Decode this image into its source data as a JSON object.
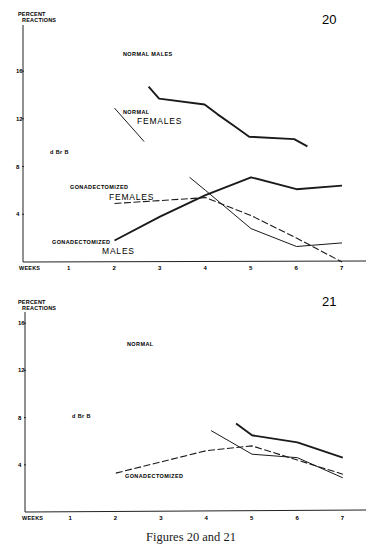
{
  "caption": "Figures 20 and 21",
  "chart_data": [
    {
      "type": "line",
      "figure_number": "20",
      "ylabel": "PERCENT REACTIONS",
      "xlabel": "WEEKS",
      "xticks": [
        1,
        2,
        3,
        4,
        5,
        6,
        7
      ],
      "yticks": [
        4,
        8,
        12,
        16
      ],
      "xlim": [
        0,
        7.6
      ],
      "ylim": [
        0,
        18
      ],
      "grid": false,
      "annotations": [
        "d Br B"
      ],
      "series": [
        {
          "name": "Normal males",
          "label_lines": [
            "NORMAL MALES"
          ],
          "style": "thick-solid",
          "points": [
            [
              2.75,
              14.7
            ],
            [
              2.98,
              13.7
            ],
            [
              3.98,
              13.2
            ],
            [
              4.26,
              12.4
            ],
            [
              4.67,
              11.3
            ],
            [
              4.96,
              10.5
            ],
            [
              5.95,
              10.3
            ],
            [
              6.24,
              9.7
            ]
          ]
        },
        {
          "name": "Normal females",
          "label_lines": [
            "NORMAL",
            "FEMALES"
          ],
          "style": "thin-solid",
          "points": [
            [
              2.0,
              12.9
            ],
            [
              2.65,
              10.1
            ]
          ]
        },
        {
          "name": "Gonadectomized males",
          "label_lines": [
            "GONADECTOMIZED",
            "MALES"
          ],
          "style": "thick-solid",
          "points": [
            [
              2,
              1.8
            ],
            [
              3,
              3.8
            ],
            [
              4,
              5.6
            ],
            [
              5,
              7.1
            ],
            [
              6,
              6.1
            ],
            [
              7,
              6.4
            ]
          ]
        },
        {
          "name": "Gonadectomized (thin)",
          "style": "thin-solid",
          "points": [
            [
              3.65,
              7.1
            ],
            [
              4,
              6.0
            ],
            [
              5,
              2.8
            ],
            [
              6,
              1.3
            ],
            [
              7,
              1.6
            ]
          ]
        },
        {
          "name": "Gonadectomized females",
          "label_lines": [
            "GONADECTOMIZED",
            "FEMALES"
          ],
          "style": "dashed",
          "points": [
            [
              2,
              4.9
            ],
            [
              4,
              5.4
            ],
            [
              5,
              3.9
            ],
            [
              6,
              2.0
            ],
            [
              7,
              0
            ]
          ]
        }
      ]
    },
    {
      "type": "line",
      "figure_number": "21",
      "ylabel": "PERCENT REACTIONS",
      "xlabel": "WEEKS",
      "xticks": [
        1,
        2,
        3,
        4,
        5,
        6,
        7
      ],
      "yticks": [
        4,
        8,
        12,
        16
      ],
      "xlim": [
        0,
        7.6
      ],
      "ylim": [
        0,
        17
      ],
      "grid": false,
      "annotations": [
        "d Br B",
        "NORMAL",
        "GONADECTOMIZED"
      ],
      "series": [
        {
          "name": "Thick solid",
          "style": "thick-solid",
          "points": [
            [
              4.65,
              7.5
            ],
            [
              5,
              6.5
            ],
            [
              6,
              5.9
            ],
            [
              7,
              4.6
            ]
          ]
        },
        {
          "name": "Thin solid",
          "style": "thin-solid",
          "points": [
            [
              4.1,
              6.9
            ],
            [
              5,
              4.9
            ],
            [
              6,
              4.6
            ],
            [
              7,
              2.9
            ]
          ]
        },
        {
          "name": "Gonadectomized",
          "style": "dashed",
          "points": [
            [
              2,
              3.3
            ],
            [
              4,
              5.2
            ],
            [
              5,
              5.6
            ],
            [
              6,
              4.4
            ],
            [
              7,
              3.2
            ]
          ]
        }
      ]
    }
  ],
  "labels": {
    "fig20": {
      "normal_males": "NORMAL MALES",
      "normal": "NORMAL",
      "females": "FEMALES",
      "gonad_f_1": "GONADECTOMIZED",
      "gonad_f_2": "FEMALES",
      "gonad_m_1": "GONADECTOMIZED",
      "gonad_m_2": "MALES",
      "annot": "d Br B"
    },
    "fig21": {
      "normal": "NORMAL",
      "gonad": "GONADECTOMIZED",
      "annot": "d Br B"
    },
    "axis": {
      "percent": "PERCENT",
      "reactions": "REACTIONS",
      "weeks": "WEEKS"
    }
  }
}
